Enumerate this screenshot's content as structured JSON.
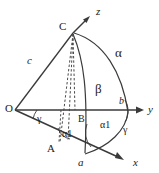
{
  "figure": {
    "type": "geometry-diagram",
    "stroke_color": "#3a3a3a",
    "dashed_color": "#4a4a4a",
    "label_color": "#1a1a1a",
    "background_color": "#ffffff"
  },
  "axes": [
    {
      "id": "z",
      "label": "z",
      "x": 96,
      "y": 15,
      "font_size": 11,
      "italic": true
    },
    {
      "id": "y",
      "label": "y",
      "x": 148,
      "y": 113,
      "font_size": 11,
      "italic": true
    },
    {
      "id": "x",
      "label": "x",
      "x": 133,
      "y": 166,
      "font_size": 11,
      "italic": true
    }
  ],
  "points": [
    {
      "id": "O",
      "label": "O",
      "x": 5,
      "y": 112,
      "font_size": 11
    },
    {
      "id": "C",
      "label": "C",
      "x": 59,
      "y": 30,
      "font_size": 11
    },
    {
      "id": "A",
      "label": "A",
      "x": 47,
      "y": 152,
      "font_size": 11
    },
    {
      "id": "B",
      "label": "B",
      "x": 78,
      "y": 122,
      "font_size": 10
    },
    {
      "id": "a",
      "label": "a",
      "x": 78,
      "y": 166,
      "font_size": 11,
      "italic": true
    },
    {
      "id": "b",
      "label": "b",
      "x": 119,
      "y": 104,
      "font_size": 10,
      "italic": true
    }
  ],
  "sides": [
    {
      "id": "c",
      "label": "c",
      "x": 27,
      "y": 64,
      "font_size": 11,
      "italic": true
    },
    {
      "id": "alpha",
      "label": "α",
      "x": 115,
      "y": 57,
      "font_size": 13
    },
    {
      "id": "beta",
      "label": "β",
      "x": 95,
      "y": 93,
      "font_size": 13
    }
  ],
  "angles": [
    {
      "id": "gamma-origin",
      "label": "γ",
      "x": 37,
      "y": 122,
      "font_size": 10
    },
    {
      "id": "alpha1-A",
      "label": "α1",
      "x": 62,
      "y": 137,
      "font_size": 10
    },
    {
      "id": "alpha1-a",
      "label": "α1",
      "x": 100,
      "y": 128,
      "font_size": 10
    },
    {
      "id": "gamma-right",
      "label": "γ",
      "x": 123,
      "y": 133,
      "font_size": 10
    }
  ],
  "geometry": {
    "origin": {
      "x": 15,
      "y": 110
    },
    "apex_C": {
      "x": 73,
      "y": 33
    },
    "point_A": {
      "x": 58,
      "y": 144
    },
    "point_B": {
      "x": 73,
      "y": 110
    },
    "point_a": {
      "x": 84,
      "y": 154
    },
    "point_b": {
      "x": 126,
      "y": 110
    }
  }
}
